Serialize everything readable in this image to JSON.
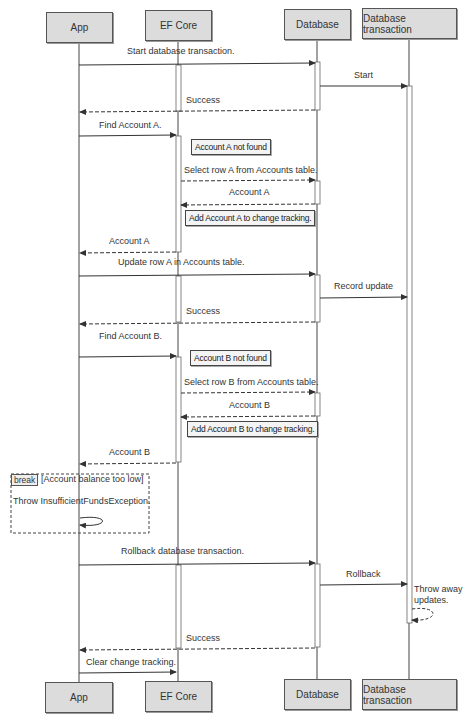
{
  "diagram": {
    "type": "sequence-diagram",
    "participants": [
      "App",
      "EF Core",
      "Database",
      "Database transaction"
    ],
    "messages": [
      {
        "from": "App",
        "to": "Database",
        "label": "Start database transaction.",
        "style": "solid"
      },
      {
        "from": "Database",
        "to": "Database transaction",
        "label": "Start",
        "style": "solid"
      },
      {
        "from": "Database",
        "to": "App",
        "label": "Success",
        "style": "dashed"
      },
      {
        "from": "App",
        "to": "EF Core",
        "label": "Find Account A.",
        "style": "solid"
      },
      {
        "from": "EF Core",
        "to": "Database",
        "label": "Select row A from Accounts table.",
        "style": "dashed"
      },
      {
        "from": "Database",
        "to": "EF Core",
        "label": "Account A",
        "style": "dashed"
      },
      {
        "from": "EF Core",
        "to": "App",
        "label": "Account A",
        "style": "dashed"
      },
      {
        "from": "App",
        "to": "Database",
        "label": "Update row A in Accounts table.",
        "style": "solid"
      },
      {
        "from": "Database",
        "to": "Database transaction",
        "label": "Record update",
        "style": "solid"
      },
      {
        "from": "Database",
        "to": "App",
        "label": "Success",
        "style": "dashed"
      },
      {
        "from": "App",
        "to": "EF Core",
        "label": "Find Account B.",
        "style": "solid"
      },
      {
        "from": "EF Core",
        "to": "Database",
        "label": "Select row B from Accounts table.",
        "style": "dashed"
      },
      {
        "from": "Database",
        "to": "EF Core",
        "label": "Account B",
        "style": "dashed"
      },
      {
        "from": "EF Core",
        "to": "App",
        "label": "Account B",
        "style": "dashed"
      },
      {
        "from": "App",
        "to": "App",
        "label": "Throw InsufficientFundsException.",
        "style": "solid"
      },
      {
        "from": "App",
        "to": "Database",
        "label": "Rollback database transaction.",
        "style": "solid"
      },
      {
        "from": "Database",
        "to": "Database transaction",
        "label": "Rollback",
        "style": "solid"
      },
      {
        "from": "Database transaction",
        "to": "Database transaction",
        "label": "Throw away updates.",
        "style": "dashed"
      },
      {
        "from": "Database",
        "to": "App",
        "label": "Success",
        "style": "dashed"
      },
      {
        "from": "App",
        "to": "EF Core",
        "label": "Clear change tracking.",
        "style": "solid"
      }
    ],
    "notes": [
      "Account A not found",
      "Add Account A to change tracking.",
      "Account B not found",
      "Add Account B to change tracking."
    ],
    "fragment": {
      "kind": "break",
      "guard": "[Account balance too low]"
    },
    "labels": {
      "m1": "Start database transaction.",
      "m2": "Start",
      "m3": "Success",
      "m4": "Find Account A.",
      "n1": "Account A not found",
      "m5": "Select row A from Accounts table.",
      "m6": "Account A",
      "n2": "Add Account A to change tracking.",
      "m7": "Account A",
      "m8": "Update row A in Accounts table.",
      "m9": "Record update",
      "m10": "Success",
      "m11": "Find Account B.",
      "n3": "Account B not found",
      "m12": "Select row B from Accounts table.",
      "m13": "Account B",
      "n4": "Add Account B to change tracking.",
      "m14": "Account B",
      "break_tag": "break",
      "break_guard": "[Account balance too low]",
      "m15": "Throw InsufficientFundsException.",
      "m16": "Rollback database transaction.",
      "m17": "Rollback",
      "m18a": "Throw away",
      "m18b": "updates.",
      "m19": "Success",
      "m20": "Clear change tracking."
    }
  },
  "colors": {
    "participant_fill": "#dcdcdc",
    "line": "#444444",
    "text": "#333333"
  }
}
